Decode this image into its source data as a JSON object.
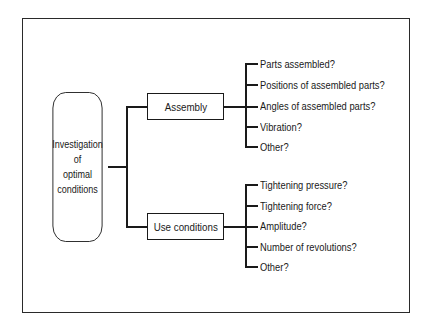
{
  "diagram": {
    "type": "tree",
    "root": {
      "label_lines": [
        "Investigation",
        "of",
        "optimal",
        "conditions"
      ]
    },
    "branches": [
      {
        "label": "Assembly",
        "items": [
          "Parts assembled?",
          "Positions of assembled parts?",
          "Angles of assembled parts?",
          "Vibration?",
          "Other?"
        ]
      },
      {
        "label": "Use conditions",
        "items": [
          "Tightening pressure?",
          "Tightening force?",
          "Amplitude?",
          "Number of revolutions?",
          "Other?"
        ]
      }
    ]
  }
}
